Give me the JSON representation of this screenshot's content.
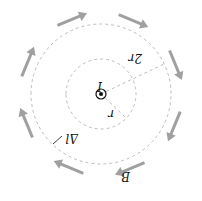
{
  "diagram": {
    "orientation": "rotated 180 degrees",
    "labels": {
      "current": "I",
      "inner_radius": "r",
      "outer_radius": "2r",
      "field": "B",
      "element": "Δl"
    },
    "colors": {
      "arrow": "#a0a0a0",
      "dashed": "#bdbdbd",
      "text": "#111111"
    },
    "field_arrow_count": 8
  }
}
